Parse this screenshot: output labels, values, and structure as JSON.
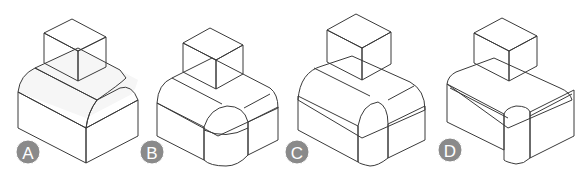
{
  "figure": {
    "options": [
      {
        "label": "A",
        "variant": "rounded top-back edges only"
      },
      {
        "label": "B",
        "variant": "rounded top edges and rounded vertical front corner with spherical corner"
      },
      {
        "label": "C",
        "variant": "larger rounded top edges and vertical front corner"
      },
      {
        "label": "D",
        "variant": "small fillets on top edges and vertical front corner"
      }
    ]
  },
  "colors": {
    "top_face": "#f4f4f4",
    "left_face": "#d8d8d8",
    "right_face": "#eaeaea",
    "edge": "#3a3a3a",
    "label_circle": "#8a8a8a",
    "label_text": "#ffffff"
  }
}
